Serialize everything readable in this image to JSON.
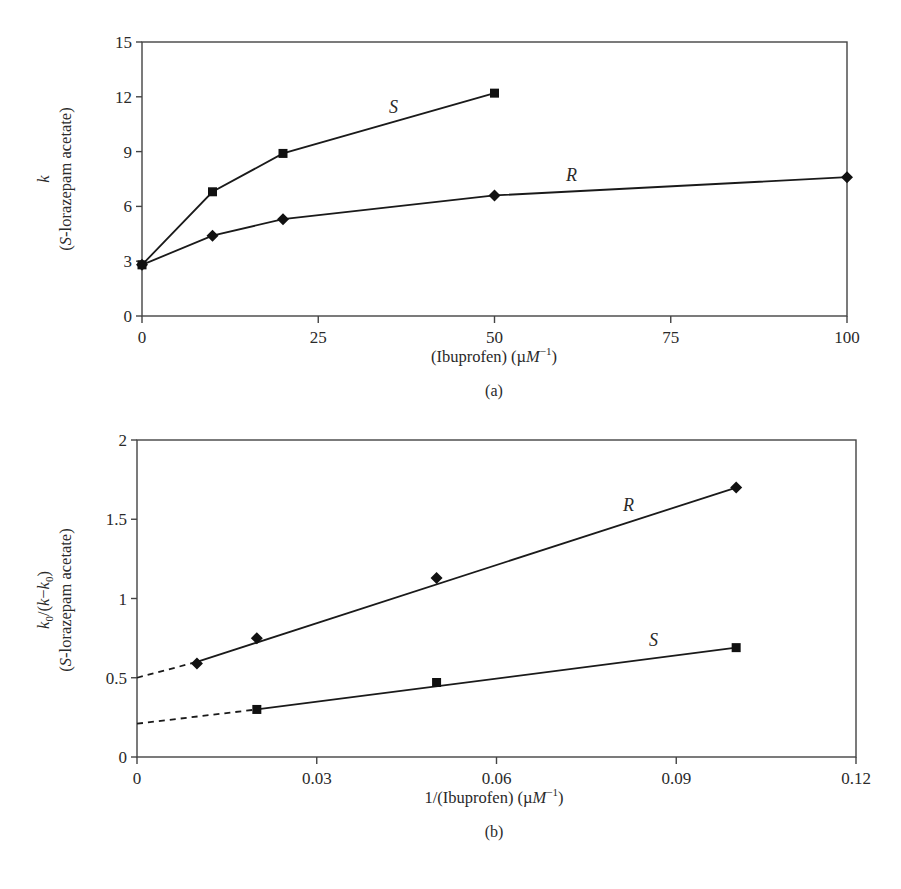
{
  "chart_data": [
    {
      "panel": "(a)",
      "type": "line",
      "title": "",
      "xlabel": "(Ibuprofen) (µM⁻¹)",
      "ylabel_line1": "k",
      "ylabel_line2": "(S-lorazepam acetate)",
      "xlim": [
        0,
        100
      ],
      "ylim": [
        0,
        15
      ],
      "xticks": [
        0,
        25,
        50,
        75,
        100
      ],
      "yticks": [
        0,
        3,
        6,
        9,
        12,
        15
      ],
      "grid": false,
      "legend": "inline labels",
      "series": [
        {
          "name": "S",
          "marker": "square",
          "x": [
            0,
            10,
            20,
            50
          ],
          "y": [
            2.8,
            6.8,
            8.9,
            12.2
          ],
          "label_pos": [
            35,
            12.3
          ]
        },
        {
          "name": "R",
          "marker": "diamond",
          "x": [
            0,
            10,
            20,
            50,
            100
          ],
          "y": [
            2.8,
            4.4,
            5.3,
            6.6,
            7.6
          ],
          "label_pos": [
            61,
            7.1
          ]
        }
      ]
    },
    {
      "panel": "(b)",
      "type": "line",
      "title": "",
      "xlabel": "1/(Ibuprofen) (µM⁻¹)",
      "ylabel_line1": "k0/(k−k0)",
      "ylabel_line2": "(S-lorazepam acetate)",
      "xlim": [
        0,
        0.12
      ],
      "ylim": [
        0,
        2
      ],
      "xticks": [
        0,
        0.03,
        0.06,
        0.09,
        0.12
      ],
      "xtick_labels": [
        "0",
        "0.03",
        "0.06",
        "0.09",
        "0.12"
      ],
      "yticks": [
        0,
        0.5,
        1,
        1.5,
        2
      ],
      "ytick_labels": [
        "0",
        "0.5",
        "1",
        "1.5",
        "2"
      ],
      "grid": false,
      "legend": "inline labels",
      "series": [
        {
          "name": "R",
          "marker": "diamond",
          "x": [
            0.01,
            0.02,
            0.05,
            0.1
          ],
          "y": [
            0.59,
            0.75,
            1.13,
            1.7
          ],
          "fit_start": [
            0.01,
            0.6
          ],
          "fit_end": [
            0.1,
            1.7
          ],
          "extrapolated_intercept": 0.5,
          "label_pos": [
            0.076,
            1.58
          ]
        },
        {
          "name": "S",
          "marker": "square",
          "x": [
            0.02,
            0.05,
            0.1
          ],
          "y": [
            0.3,
            0.47,
            0.69
          ],
          "fit_start": [
            0.02,
            0.3
          ],
          "fit_end": [
            0.1,
            0.69
          ],
          "extrapolated_intercept": 0.21,
          "label_pos": [
            0.082,
            0.76
          ]
        }
      ]
    }
  ],
  "labels": {
    "a": {
      "xticks": [
        "0",
        "25",
        "50",
        "75",
        "100"
      ],
      "yticks": [
        "0",
        "3",
        "6",
        "9",
        "12",
        "15"
      ],
      "xlabel_main": "(Ibuprofen) (µ",
      "xlabel_M": "M",
      "xlabel_sup": "−1",
      "xlabel_close": ")",
      "ylabel_k": "k",
      "ylabel_paren_open": "(",
      "ylabel_S": "S",
      "ylabel_rest": "-lorazepam acetate)",
      "series_S": "S",
      "series_R": "R",
      "panel": "(a)"
    },
    "b": {
      "xticks": [
        "0",
        "0.03",
        "0.06",
        "0.09",
        "0.12"
      ],
      "yticks": [
        "0",
        "0.5",
        "1",
        "1.5",
        "2"
      ],
      "xlabel_main": "1/(Ibuprofen) (µ",
      "xlabel_M": "M",
      "xlabel_sup": "−1",
      "xlabel_close": ")",
      "ylabel_k": "k",
      "ylabel_sub0": "0",
      "ylabel_mid": "/(",
      "ylabel_k2": "k",
      "ylabel_minus": "−",
      "ylabel_k3": "k",
      "ylabel_sub0b": "0",
      "ylabel_close": ")",
      "ylabel_paren_open": "(",
      "ylabel_S": "S",
      "ylabel_rest": "-lorazepam acetate)",
      "series_R": "R",
      "series_S": "S",
      "panel": "(b)"
    }
  }
}
